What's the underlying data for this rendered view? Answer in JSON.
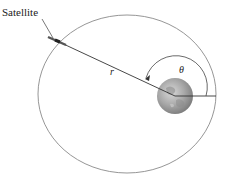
{
  "diagram": {
    "labels": {
      "satellite": "Satellite",
      "radius": "r",
      "angle": "θ"
    },
    "orbit": {
      "cx": 127,
      "cy": 94,
      "rx": 89,
      "ry": 79,
      "color": "#8a8a8a"
    },
    "earth": {
      "cx": 175,
      "cy": 96,
      "r": 18,
      "color": "#a9a9a9"
    },
    "satellite": {
      "x": 57,
      "y": 41
    },
    "colors": {
      "line": "#333333",
      "orbit": "#8a8a8a"
    }
  }
}
